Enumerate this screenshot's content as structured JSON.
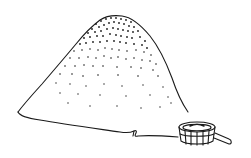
{
  "illustration": {
    "subject": "pile of grain with wooden scoop",
    "style": "black ink line drawing",
    "colors": {
      "ink": "#1a1a1a",
      "background": "#ffffff"
    },
    "elements": [
      {
        "name": "grain-pile",
        "description": "large conical heap, stippled with dots, denser near the top"
      },
      {
        "name": "wooden-scoop",
        "description": "small slatted wooden bucket with a short handle, at lower right"
      }
    ]
  }
}
